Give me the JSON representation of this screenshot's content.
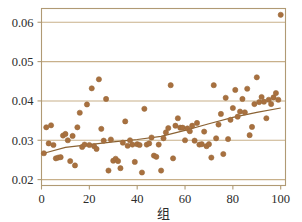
{
  "chart_data": {
    "type": "scatter",
    "title": "",
    "subtitle": "",
    "xlabel": "组",
    "ylabel": "",
    "xlim": [
      0,
      102
    ],
    "ylim": [
      0.0185,
      0.0635
    ],
    "grid": true,
    "grid_axis": "y",
    "legend": "none",
    "point_color": "#9a6b3c",
    "point_fill": "#a8703f",
    "line_color": "#8a6233",
    "grid_color": "#c8b08a",
    "frame_color": "#b09a74",
    "text_color": "#2b2b2b",
    "background": "#ffffff",
    "xticks": [
      0,
      20,
      40,
      60,
      80,
      100
    ],
    "xtick_labels": [
      "0",
      "20",
      "40",
      "60",
      "80",
      "100"
    ],
    "yticks": [
      0.02,
      0.03,
      0.04,
      0.05,
      0.06
    ],
    "ytick_labels": [
      "0.02",
      "0.03",
      "0.04",
      "0.05",
      "0.06"
    ],
    "marker_size": 2.6,
    "series": [
      {
        "name": "observations",
        "x": [
          1,
          2,
          3,
          4,
          5,
          6,
          7,
          8,
          9,
          10,
          11,
          12,
          13,
          14,
          15,
          16,
          17,
          18,
          19,
          20,
          21,
          22,
          23,
          24,
          25,
          26,
          27,
          28,
          29,
          30,
          31,
          32,
          33,
          34,
          35,
          36,
          37,
          38,
          39,
          40,
          41,
          42,
          43,
          44,
          45,
          46,
          47,
          48,
          49,
          50,
          51,
          52,
          53,
          54,
          55,
          56,
          57,
          58,
          59,
          60,
          61,
          62,
          63,
          64,
          65,
          66,
          67,
          68,
          69,
          70,
          71,
          72,
          73,
          74,
          75,
          76,
          77,
          78,
          79,
          80,
          81,
          82,
          83,
          84,
          85,
          86,
          87,
          88,
          89,
          90,
          91,
          92,
          93,
          94,
          95,
          96,
          97,
          98,
          99,
          100
        ],
        "y": [
          0.0267,
          0.0333,
          0.0292,
          0.0338,
          0.0288,
          0.0254,
          0.0256,
          0.0257,
          0.0312,
          0.0316,
          0.03,
          0.0247,
          0.0311,
          0.0236,
          0.0333,
          0.037,
          0.0283,
          0.0289,
          0.0391,
          0.0288,
          0.0432,
          0.0285,
          0.0278,
          0.0455,
          0.0329,
          0.0299,
          0.0405,
          0.0223,
          0.0302,
          0.0248,
          0.0253,
          0.0247,
          0.0229,
          0.0294,
          0.0348,
          0.0286,
          0.03,
          0.0289,
          0.0245,
          0.029,
          0.0288,
          0.0218,
          0.038,
          0.0289,
          0.0292,
          0.0307,
          0.0261,
          0.0258,
          0.0289,
          0.0223,
          0.0305,
          0.032,
          0.0331,
          0.044,
          0.0254,
          0.0337,
          0.0356,
          0.0332,
          0.0332,
          0.03,
          0.033,
          0.0323,
          0.0337,
          0.0299,
          0.0344,
          0.0289,
          0.029,
          0.0322,
          0.0285,
          0.029,
          0.0256,
          0.044,
          0.0305,
          0.034,
          0.0367,
          0.0265,
          0.0408,
          0.0303,
          0.0352,
          0.0382,
          0.0428,
          0.036,
          0.0373,
          0.0405,
          0.0371,
          0.0431,
          0.0313,
          0.0334,
          0.0392,
          0.046,
          0.0397,
          0.041,
          0.0398,
          0.0356,
          0.0403,
          0.0392,
          0.0409,
          0.042,
          0.0403,
          0.0619
        ]
      }
    ],
    "trend_line": {
      "name": "fitted-trend",
      "x_start": 1,
      "y_start": 0.0267,
      "x_end": 100,
      "y_end": 0.0382,
      "points_x": [
        1,
        10,
        20,
        30,
        40,
        50,
        60,
        70,
        80,
        90,
        100
      ],
      "points_y": [
        0.0267,
        0.0282,
        0.0289,
        0.0296,
        0.0302,
        0.031,
        0.0325,
        0.0342,
        0.0358,
        0.0371,
        0.0382
      ]
    },
    "annotations": [
      {
        "name": "outlier-point",
        "x": 100,
        "y": 0.0619
      }
    ]
  }
}
